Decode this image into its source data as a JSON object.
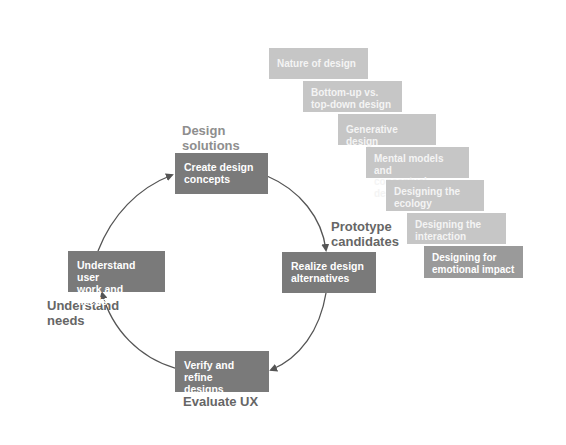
{
  "diagram": {
    "type": "cycle",
    "cycle_nodes": [
      {
        "id": "create",
        "text": "Create design concepts",
        "line1": "Create design",
        "line2": "concepts",
        "stage_label_line1": "Design",
        "stage_label_line2": "solutions"
      },
      {
        "id": "realize",
        "text": "Realize design alternatives",
        "line1": "Realize design",
        "line2": "alternatives",
        "stage_label_line1": "Prototype",
        "stage_label_line2": "candidates"
      },
      {
        "id": "verify",
        "text": "Verify and refine designs",
        "line1": "Verify and refine",
        "line2": "designs",
        "stage_label_line1": "Evaluate UX"
      },
      {
        "id": "understand",
        "text": "Understand user work and needs",
        "line1": "Understand user",
        "line2": "work and needs",
        "stage_label_line1": "Understand",
        "stage_label_line2": "needs"
      }
    ],
    "edges": [
      {
        "from": "understand",
        "to": "create"
      },
      {
        "from": "create",
        "to": "realize"
      },
      {
        "from": "realize",
        "to": "verify"
      },
      {
        "from": "verify",
        "to": "understand"
      }
    ],
    "design_topics": [
      {
        "line1": "Nature of design",
        "line2": ""
      },
      {
        "line1": "Bottom-up vs.",
        "line2": "top-down design"
      },
      {
        "line1": "Generative design",
        "line2": ""
      },
      {
        "line1": "Mental models and",
        "line2": "conceptual design"
      },
      {
        "line1": "Designing the",
        "line2": "ecology"
      },
      {
        "line1": "Designing the",
        "line2": "interaction"
      },
      {
        "line1": "Designing for",
        "line2": "emotional impact"
      }
    ],
    "colors": {
      "main_box": "#7a7a7a",
      "topic_box": "#c6c6c6",
      "topic_box_last": "#9a9a9a",
      "arrow": "#555555",
      "label_text": "#666666"
    }
  }
}
